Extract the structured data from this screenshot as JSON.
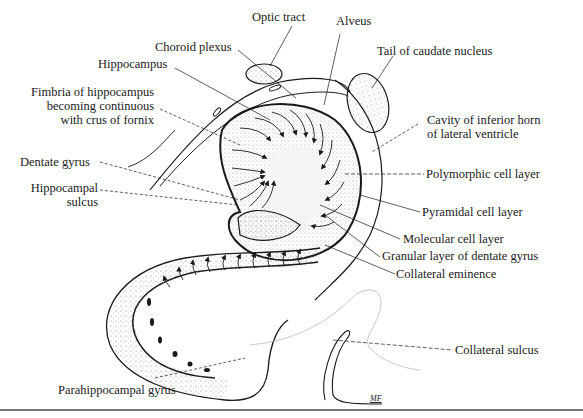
{
  "figure": {
    "artist_initials": "MF",
    "colors": {
      "ink": "#1a1a1a",
      "stipple": "#9a9a9a",
      "rule": "#777777"
    }
  },
  "labels": {
    "optic_tract": "Optic tract",
    "alveus": "Alveus",
    "choroid_plexus": "Choroid plexus",
    "tail_caudate": "Tail of caudate nucleus",
    "hippocampus": "Hippocampus",
    "fimbria_1": "Fimbria of hippocampus",
    "fimbria_2": "becoming continuous",
    "fimbria_3": "with crus of fornix",
    "cavity_1": "Cavity of inferior horn",
    "cavity_2": "of lateral ventricle",
    "dentate_gyrus": "Dentate gyrus",
    "polymorphic": "Polymorphic cell layer",
    "hippocampal_sulcus_1": "Hippocampal",
    "hippocampal_sulcus_2": "sulcus",
    "pyramidal": "Pyramidal cell layer",
    "molecular": "Molecular cell layer",
    "granular": "Granular layer of dentate gyrus",
    "collateral_eminence": "Collateral eminence",
    "collateral_sulcus": "Collateral sulcus",
    "parahippocampal": "Parahippocampal gyrus"
  }
}
